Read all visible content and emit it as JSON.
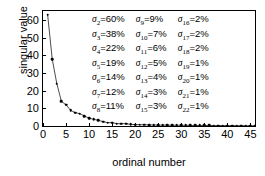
{
  "chart_data": {
    "type": "line",
    "title": "",
    "xlabel": "ordinal number",
    "ylabel": "singular value",
    "xlim": [
      0,
      46
    ],
    "ylim": [
      0,
      65
    ],
    "xticks": [
      0,
      5,
      10,
      15,
      20,
      25,
      30,
      35,
      40,
      45
    ],
    "yticks": [
      0,
      10,
      20,
      30,
      40,
      50,
      60
    ],
    "grid": false,
    "legend_position": "inside-upper-right",
    "marker": "dot",
    "x": [
      1,
      2,
      3,
      4,
      5,
      6,
      7,
      8,
      9,
      10,
      11,
      12,
      13,
      14,
      15,
      16,
      17,
      18,
      19,
      20,
      21,
      22,
      23,
      24,
      25,
      26,
      27,
      28,
      29,
      30,
      31,
      32,
      33,
      34,
      35,
      36,
      37,
      38,
      39,
      40,
      41,
      42,
      43,
      44,
      45,
      46
    ],
    "values": [
      63.0,
      37.8,
      23.9,
      13.9,
      12.0,
      8.8,
      7.6,
      6.9,
      5.7,
      4.4,
      3.8,
      3.2,
      2.5,
      1.9,
      1.9,
      1.3,
      1.3,
      1.3,
      0.9,
      0.8,
      0.7,
      0.7,
      0.6,
      0.6,
      0.5,
      0.5,
      0.5,
      0.4,
      0.4,
      0.4,
      0.4,
      0.3,
      0.3,
      0.3,
      0.3,
      0.3,
      0.25,
      0.25,
      0.22,
      0.2,
      0.2,
      0.18,
      0.17,
      0.15,
      0.14,
      0.12
    ]
  },
  "legend": {
    "columns": [
      {
        "entries": [
          {
            "symbol": "σ",
            "index": "2",
            "eq": "=",
            "value": "60%"
          },
          {
            "symbol": "σ",
            "index": "3",
            "eq": "=",
            "value": "38%"
          },
          {
            "symbol": "σ",
            "index": "4",
            "eq": "=",
            "value": "22%"
          },
          {
            "symbol": "σ",
            "index": "5",
            "eq": "=",
            "value": "19%"
          },
          {
            "symbol": "σ",
            "index": "6",
            "eq": "=",
            "value": "14%"
          },
          {
            "symbol": "σ",
            "index": "7",
            "eq": "=",
            "value": "12%"
          },
          {
            "symbol": "σ",
            "index": "8",
            "eq": "=",
            "value": "11%"
          }
        ]
      },
      {
        "entries": [
          {
            "symbol": "σ",
            "index": "9",
            "eq": "=",
            "value": "9%"
          },
          {
            "symbol": "σ",
            "index": "10",
            "eq": "=",
            "value": "7%"
          },
          {
            "symbol": "σ",
            "index": "11",
            "eq": "=",
            "value": "6%"
          },
          {
            "symbol": "σ",
            "index": "12",
            "eq": "=",
            "value": "5%"
          },
          {
            "symbol": "σ",
            "index": "13",
            "eq": "=",
            "value": "4%"
          },
          {
            "symbol": "σ",
            "index": "14",
            "eq": "=",
            "value": "3%"
          },
          {
            "symbol": "σ",
            "index": "15",
            "eq": "=",
            "value": "3%"
          }
        ]
      },
      {
        "entries": [
          {
            "symbol": "σ",
            "index": "16",
            "eq": "=",
            "value": "2%"
          },
          {
            "symbol": "σ",
            "index": "17",
            "eq": "=",
            "value": "2%"
          },
          {
            "symbol": "σ",
            "index": "18",
            "eq": "=",
            "value": "2%"
          },
          {
            "symbol": "σ",
            "index": "19",
            "eq": "=",
            "value": "1%"
          },
          {
            "symbol": "σ",
            "index": "20",
            "eq": "=",
            "value": "1%"
          },
          {
            "symbol": "σ",
            "index": "21",
            "eq": "=",
            "value": "1%"
          },
          {
            "symbol": "σ",
            "index": "22",
            "eq": "=",
            "value": "1%"
          }
        ]
      }
    ]
  },
  "colors": {
    "axis": "#000000",
    "data": "#000000",
    "background": "#ffffff"
  }
}
